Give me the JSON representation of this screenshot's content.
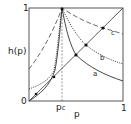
{
  "diagram": {
    "y_axis_label": "h(p)",
    "x_axis_label": "p",
    "y_top_tick": "1",
    "origin_tick": "0",
    "x_right_tick": "1",
    "critical_label": "p",
    "critical_subscript": "c",
    "curves": [
      {
        "name": "a",
        "style": "solid"
      },
      {
        "name": "b",
        "style": "dotted"
      },
      {
        "name": "c",
        "style": "long-dash"
      }
    ],
    "reference_line": "diagonal h(p)=p",
    "critical_line": "dashed vertical at p_c"
  }
}
